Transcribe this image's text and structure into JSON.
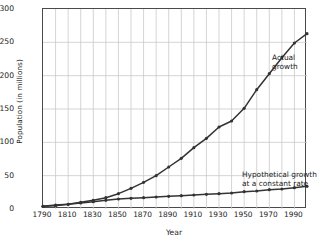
{
  "chart_data": {
    "type": "line",
    "title": "",
    "xlabel": "Year",
    "ylabel": "Population (in millions)",
    "xlim": [
      1790,
      2000
    ],
    "ylim": [
      0,
      300
    ],
    "grid": true,
    "legend_position": "inline-annotation",
    "x_ticks": [
      1790,
      1810,
      1830,
      1850,
      1870,
      1890,
      1910,
      1930,
      1950,
      1970,
      1990
    ],
    "x_tick_labels": [
      "1790",
      "1810",
      "1830",
      "1850",
      "1870",
      "1890",
      "1910",
      "1930",
      "1950",
      "1970",
      "1990"
    ],
    "x_gridlines": [
      1790,
      1800,
      1810,
      1820,
      1830,
      1840,
      1850,
      1860,
      1870,
      1880,
      1890,
      1900,
      1910,
      1920,
      1930,
      1940,
      1950,
      1960,
      1970,
      1980,
      1990,
      2000
    ],
    "y_ticks": [
      0,
      50,
      100,
      150,
      200,
      250,
      300
    ],
    "y_tick_labels": [
      "0",
      "50",
      "100",
      "150",
      "200",
      "250",
      "300"
    ],
    "x": [
      1790,
      1800,
      1810,
      1820,
      1830,
      1840,
      1850,
      1860,
      1870,
      1880,
      1890,
      1900,
      1910,
      1920,
      1930,
      1940,
      1950,
      1960,
      1970,
      1980,
      1990,
      2000
    ],
    "series": [
      {
        "name": "Actual growth",
        "color": "#333333",
        "marker": "circle",
        "values": [
          4,
          5,
          7,
          10,
          13,
          17,
          23,
          31,
          40,
          50,
          63,
          76,
          92,
          106,
          123,
          132,
          151,
          179,
          203,
          227,
          249,
          263
        ]
      },
      {
        "name": "Hypothetical growth at a constant rate",
        "color": "#333333",
        "marker": "circle",
        "values": [
          4,
          6,
          7,
          9,
          11,
          13,
          15,
          16,
          17,
          18,
          19,
          20,
          21,
          22,
          23,
          24,
          26,
          27,
          29,
          30,
          32,
          34
        ]
      }
    ],
    "annotations": [
      {
        "id": "actual",
        "line1": "Actual",
        "line2": "growth"
      },
      {
        "id": "hypothetical",
        "line1": "Hypothetical growth",
        "line2": "at a constant rate"
      }
    ],
    "colors": {
      "line": "#333333",
      "grid": "#c9c9c9",
      "frame": "#4a4a4a",
      "text": "#1d1d1d",
      "background": "#ffffff"
    }
  }
}
